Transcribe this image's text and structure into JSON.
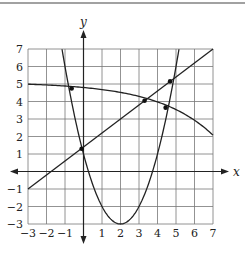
{
  "chart_data": {
    "type": "line",
    "title": "",
    "xlabel": "x",
    "ylabel": "y",
    "xlim": [
      -3,
      7
    ],
    "ylim": [
      -3,
      7
    ],
    "grid": true,
    "x_ticks": [
      "-3",
      "-2",
      "-1",
      "1",
      "2",
      "3",
      "4",
      "5",
      "6",
      "7"
    ],
    "y_ticks": [
      "7",
      "6",
      "5",
      "4",
      "3",
      "2",
      "1",
      "-1",
      "-2",
      "-3"
    ],
    "series": [
      {
        "name": "line",
        "kind": "linear",
        "equation": "y = 0.8x + 1.4",
        "points": [
          [
            -3,
            -1
          ],
          [
            7,
            7
          ]
        ]
      },
      {
        "name": "parabola",
        "kind": "quadratic",
        "equation": "y = (x-2)^2 - 3",
        "vertex": [
          2,
          -3
        ],
        "x_range": [
          -1.16,
          5.16
        ]
      },
      {
        "name": "decreasing-curve",
        "kind": "exponential",
        "equation": "y ≈ 5.1 - 0.3e^(0.33x)",
        "points": [
          [
            -3,
            5
          ],
          [
            -0.64,
            4.75
          ],
          [
            3.3,
            4.0
          ],
          [
            4.44,
            3.65
          ],
          [
            7,
            2
          ]
        ]
      }
    ],
    "marked_points": [
      {
        "x": -0.64,
        "y": 4.75
      },
      {
        "x": -0.1,
        "y": 1.3
      },
      {
        "x": 3.3,
        "y": 4.04
      },
      {
        "x": 4.44,
        "y": 3.65
      },
      {
        "x": 4.68,
        "y": 5.15
      }
    ]
  }
}
